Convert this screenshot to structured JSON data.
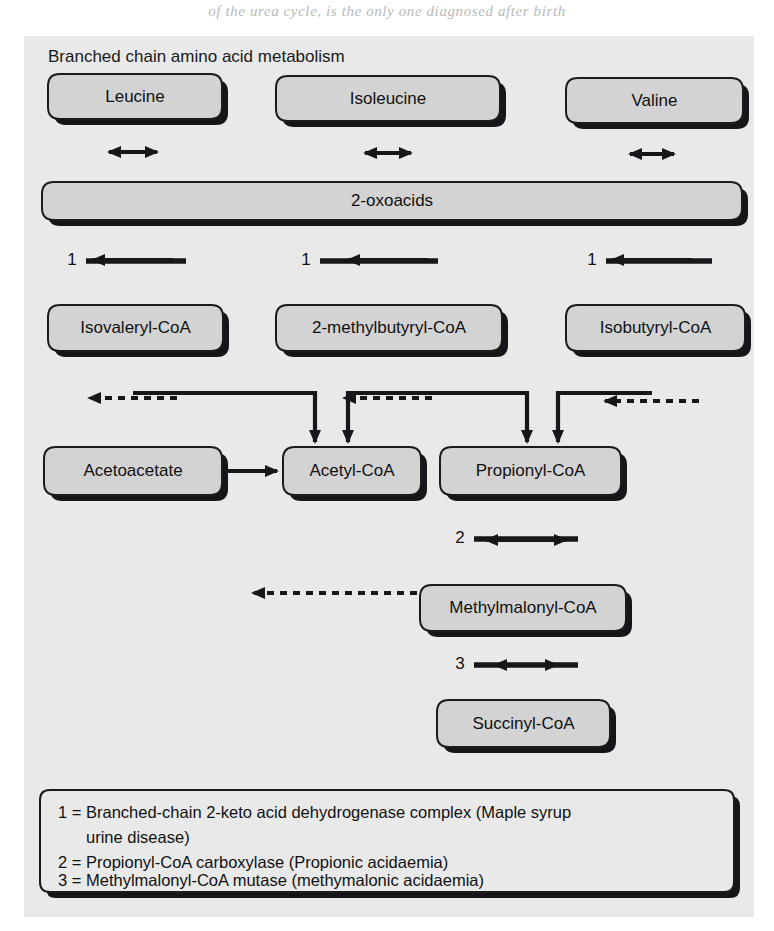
{
  "page": {
    "bleed_text": "of the urea cycle, is the only one diagnosed after birth",
    "width": 774,
    "height": 931
  },
  "figure": {
    "title": "Branched chain amino acid metabolism",
    "panel_bg": "#e9e9e9",
    "box_fill": "#d3d3d3",
    "line_color": "#17171b"
  },
  "nodes": [
    {
      "id": "leucine",
      "label": "Leucine",
      "x": 48,
      "y": 74,
      "w": 174,
      "h": 45
    },
    {
      "id": "isoleucine",
      "label": "Isoleucine",
      "x": 276,
      "y": 76,
      "w": 224,
      "h": 45
    },
    {
      "id": "valine",
      "label": "Valine",
      "x": 566,
      "y": 78,
      "w": 177,
      "h": 45
    },
    {
      "id": "oxoacids",
      "label": "2-oxoacids",
      "x": 42,
      "y": 182,
      "w": 700,
      "h": 38
    },
    {
      "id": "isovaleryl-coa",
      "label": "Isovaleryl-CoA",
      "x": 48,
      "y": 305,
      "w": 175,
      "h": 46
    },
    {
      "id": "methylbutyryl-coa",
      "label": "2-methylbutyryl-CoA",
      "x": 276,
      "y": 305,
      "w": 226,
      "h": 46
    },
    {
      "id": "isobutyryl-coa",
      "label": "Isobutyryl-CoA",
      "x": 566,
      "y": 305,
      "w": 179,
      "h": 46
    },
    {
      "id": "acetoacetate",
      "label": "Acetoacetate",
      "x": 44,
      "y": 447,
      "w": 178,
      "h": 48
    },
    {
      "id": "acetyl-coa",
      "label": "Acetyl-CoA",
      "x": 283,
      "y": 447,
      "w": 138,
      "h": 48
    },
    {
      "id": "propionyl-coa",
      "label": "Propionyl-CoA",
      "x": 440,
      "y": 447,
      "w": 181,
      "h": 48
    },
    {
      "id": "methylmalonyl-coa",
      "label": "Methylmalonyl-CoA",
      "x": 420,
      "y": 585,
      "w": 206,
      "h": 46
    },
    {
      "id": "succinyl-coa",
      "label": "Succinyl-CoA",
      "x": 437,
      "y": 700,
      "w": 173,
      "h": 47
    }
  ],
  "enzyme_markers": [
    {
      "id": "enz-1-leucine",
      "number": "1",
      "label_x": 72,
      "label_y": 261,
      "bar_x1": 86,
      "bar_x2": 186,
      "bar_y": 261
    },
    {
      "id": "enz-1-isoleucine",
      "number": "1",
      "label_x": 306,
      "label_y": 261,
      "bar_x1": 320,
      "bar_x2": 438,
      "bar_y": 261
    },
    {
      "id": "enz-1-valine",
      "number": "1",
      "label_x": 592,
      "label_y": 261,
      "bar_x1": 606,
      "bar_x2": 712,
      "bar_y": 261
    },
    {
      "id": "enz-2",
      "number": "2",
      "label_x": 460,
      "label_y": 539,
      "bar_x1": 474,
      "bar_x2": 578,
      "bar_y": 539
    },
    {
      "id": "enz-3",
      "number": "3",
      "label_x": 460,
      "label_y": 665,
      "bar_x1": 474,
      "bar_x2": 578,
      "bar_y": 665
    }
  ],
  "legend": {
    "lines": [
      "1 = Branched-chain 2-keto acid dehydrogenase complex (Maple syrup",
      "urine disease)",
      "2 = Propionyl-CoA carboxylase (Propionic acidaemia)",
      "3 = Methylmalonyl-CoA mutase (methymalonic acidaemia)"
    ],
    "box": {
      "x": 42,
      "y": 778,
      "w": 692,
      "h": 112
    }
  },
  "chart_data": {
    "type": "diagram",
    "title": "Branched chain amino acid metabolism",
    "edges": [
      {
        "from": "leucine",
        "to": "oxoacids",
        "style": "solid",
        "direction": "both"
      },
      {
        "from": "isoleucine",
        "to": "oxoacids",
        "style": "solid",
        "direction": "both"
      },
      {
        "from": "valine",
        "to": "oxoacids",
        "style": "solid",
        "direction": "both"
      },
      {
        "from": "oxoacids",
        "to": "isovaleryl-coa",
        "style": "solid",
        "direction": "down",
        "enzyme": "1"
      },
      {
        "from": "oxoacids",
        "to": "methylbutyryl-coa",
        "style": "solid",
        "direction": "down",
        "enzyme": "1"
      },
      {
        "from": "oxoacids",
        "to": "isobutyryl-coa",
        "style": "solid",
        "direction": "down",
        "enzyme": "1"
      },
      {
        "from": "isovaleryl-coa",
        "to": "acetoacetate",
        "style": "dashed",
        "direction": "down"
      },
      {
        "from": "isovaleryl-coa",
        "to": "acetyl-coa",
        "style": "solid",
        "direction": "down"
      },
      {
        "from": "methylbutyryl-coa",
        "to": "acetyl-coa",
        "style": "dashed",
        "direction": "down"
      },
      {
        "from": "methylbutyryl-coa",
        "to": "propionyl-coa",
        "style": "solid",
        "direction": "down"
      },
      {
        "from": "isobutyryl-coa",
        "to": "propionyl-coa",
        "style": "solid",
        "direction": "down"
      },
      {
        "from": "isobutyryl-coa",
        "to": "sink-right",
        "style": "dashed",
        "direction": "down"
      },
      {
        "from": "acetoacetate",
        "to": "acetyl-coa",
        "style": "solid",
        "direction": "right"
      },
      {
        "from": "acetyl-coa",
        "to": "sink-below",
        "style": "dashed",
        "direction": "down"
      },
      {
        "from": "propionyl-coa",
        "to": "methylmalonyl-coa",
        "style": "solid",
        "direction": "both",
        "enzyme": "2"
      },
      {
        "from": "methylmalonyl-coa",
        "to": "succinyl-coa",
        "style": "solid",
        "direction": "both",
        "enzyme": "3"
      }
    ]
  }
}
